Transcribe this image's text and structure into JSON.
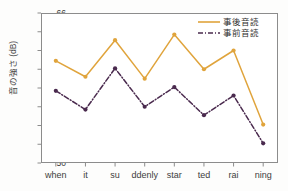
{
  "chart_data": {
    "type": "line",
    "title": "",
    "xlabel": "",
    "ylabel": "音の強さ (dB)",
    "categories": [
      "when",
      "it",
      "su",
      "ddenly",
      "star",
      "ted",
      "rai",
      "ning"
    ],
    "sentence": "when it suddenly started raining",
    "ylim": [
      50,
      66
    ],
    "yticks": [
      50,
      52,
      54,
      56,
      58,
      60,
      62,
      64,
      66
    ],
    "ytick_labels": [
      "50",
      "52",
      "54",
      "56",
      "58",
      "60",
      "62",
      "64",
      "66"
    ],
    "grid": false,
    "legend_position": "top-right",
    "series": [
      {
        "name": "事後音読",
        "values": [
          60.9,
          59.2,
          63.1,
          59.0,
          63.7,
          60.0,
          62.0,
          54.1
        ],
        "color": "#E0A43C",
        "linestyle": "solid",
        "marker": "circle"
      },
      {
        "name": "事前音読",
        "values": [
          57.7,
          55.7,
          60.1,
          56.0,
          58.1,
          55.1,
          57.2,
          52.1
        ],
        "color": "#4A2A4E",
        "linestyle": "dashdot",
        "marker": "circle"
      }
    ]
  },
  "legend": {
    "items": [
      {
        "label": "事後音読"
      },
      {
        "label": "事前音読"
      }
    ]
  },
  "axes": {
    "y_title": "音の強さ (dB)"
  }
}
